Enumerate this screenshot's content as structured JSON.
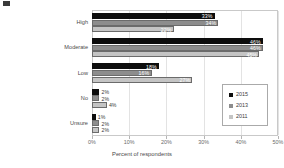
{
  "chart_data": {
    "type": "bar",
    "orientation": "horizontal",
    "title": "",
    "xlabel": "Percent of respondents",
    "ylabel": "",
    "xlim": [
      0,
      50
    ],
    "xticks": [
      "0%",
      "10%",
      "20%",
      "30%",
      "40%",
      "50%"
    ],
    "xtick_values": [
      0,
      10,
      20,
      30,
      40,
      50
    ],
    "grid": true,
    "legend_position": "center right",
    "categories": [
      "High",
      "Moderate",
      "Low",
      "No",
      "Unsure"
    ],
    "series": [
      {
        "name": "2015",
        "color": "#0d0d0d",
        "values": [
          33,
          46,
          18,
          2,
          1
        ],
        "labels": [
          "33%",
          "46%",
          "18%",
          "2%",
          "1%"
        ]
      },
      {
        "name": "2013",
        "color": "#8d8d8d",
        "values": [
          34,
          46,
          16,
          2,
          2
        ],
        "labels": [
          "34%",
          "46%",
          "16%",
          "2%",
          "2%"
        ]
      },
      {
        "name": "2011",
        "color": "#c4c4c4",
        "values": [
          22,
          45,
          27,
          4,
          2
        ],
        "labels": [
          "22%",
          "45%",
          "27%",
          "4%",
          "2%"
        ]
      }
    ]
  },
  "legend": {
    "entries": [
      {
        "label": "2015"
      },
      {
        "label": "2013"
      },
      {
        "label": "2011"
      }
    ]
  },
  "axis": {
    "x_title": "Percent of respondents"
  }
}
